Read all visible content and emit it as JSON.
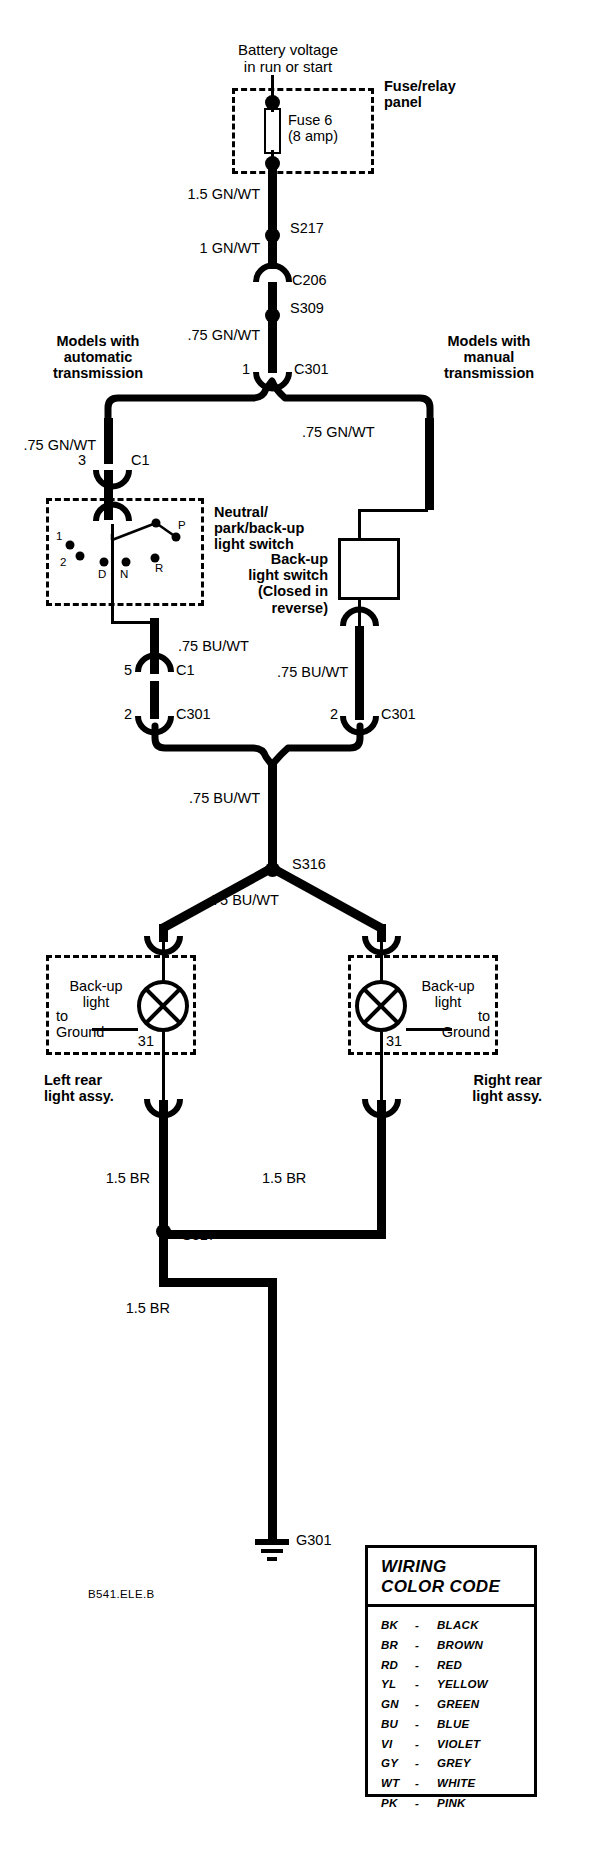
{
  "diagram": {
    "title_top": "Battery voltage\nin run or start",
    "drawing_id": "B541.ELE.B",
    "fuse_panel": {
      "label": "Fuse/relay\npanel",
      "fuse_name": "Fuse 6\n(8 amp)"
    },
    "wires": {
      "w1": "1.5 GN/WT",
      "w2": "1 GN/WT",
      "w3": ".75 GN/WT",
      "w4_left": ".75 GN/WT",
      "w4_right": ".75 GN/WT",
      "w5_left": ".75 BU/WT",
      "w5_right": ".75 BU/WT",
      "w6": ".75 BU/WT",
      "w7": ".75 BU/WT",
      "w8_left": "1.5 BR",
      "w8_right": "1.5 BR",
      "w9": "1.5 BR"
    },
    "nodes": {
      "s217": "S217",
      "c206": "C206",
      "s309": "S309",
      "c301_top": "C301",
      "c301_top_pin": "1",
      "c1_auto_in": "C1",
      "c1_auto_in_pin": "3",
      "c1_auto_out": "C1",
      "c1_auto_out_pin": "5",
      "c301_left": "C301",
      "c301_left_pin": "2",
      "c301_right": "C301",
      "c301_right_pin": "2",
      "s316": "S316",
      "s317": "S317",
      "g301": "G301",
      "pin31_left": "31",
      "pin31_right": "31"
    },
    "branch_labels": {
      "automatic": "Models with\nautomatic\ntransmission",
      "manual": "Models with\nmanual\ntransmission"
    },
    "neutral_switch": {
      "label": "Neutral/\npark/back-up\nlight switch",
      "positions": [
        "1",
        "2",
        "D",
        "N",
        "R",
        "P"
      ]
    },
    "backup_switch": {
      "label": "Back-up\nlight switch\n(Closed in\nreverse)"
    },
    "lamps": {
      "left": {
        "name": "Back-up\nlight",
        "ground_note": "to\nGround",
        "assy": "Left rear\nlight assy."
      },
      "right": {
        "name": "Back-up\nlight",
        "ground_note": "to\nGround",
        "assy": "Right rear\nlight assy."
      }
    }
  },
  "legend": {
    "title": "WIRING\nCOLOR CODE",
    "title_line1": "WIRING",
    "title_line2": "COLOR CODE",
    "dash": "-",
    "entries": [
      {
        "abbr": "BK",
        "name": "BLACK"
      },
      {
        "abbr": "BR",
        "name": "BROWN"
      },
      {
        "abbr": "RD",
        "name": "RED"
      },
      {
        "abbr": "YL",
        "name": "YELLOW"
      },
      {
        "abbr": "GN",
        "name": "GREEN"
      },
      {
        "abbr": "BU",
        "name": "BLUE"
      },
      {
        "abbr": "VI",
        "name": "VIOLET"
      },
      {
        "abbr": "GY",
        "name": "GREY"
      },
      {
        "abbr": "WT",
        "name": "WHITE"
      },
      {
        "abbr": "PK",
        "name": "PINK"
      }
    ]
  }
}
